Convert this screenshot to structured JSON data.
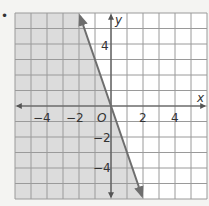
{
  "bullet": "•",
  "chart_data": {
    "type": "line",
    "title": "",
    "xlabel": "x",
    "ylabel": "y",
    "xlim": [
      -6,
      6
    ],
    "ylim": [
      -6,
      6
    ],
    "grid": true,
    "x_ticks": [
      -4,
      -2,
      2,
      4
    ],
    "y_ticks": [
      4,
      -2,
      -4
    ],
    "x_tick_labels": [
      "−4",
      "−2",
      "2",
      "4"
    ],
    "y_tick_labels": [
      "4",
      "−2",
      "−4"
    ],
    "origin_label": "O",
    "series": [
      {
        "name": "boundary line",
        "x": [
          -2,
          0,
          2
        ],
        "y": [
          6,
          0,
          -6
        ],
        "equation": "y = -3x",
        "style": "solid",
        "arrows": "both"
      }
    ],
    "shaded_region": "left of line (y < -3x)",
    "colors": {
      "shade": "#dcdcdc",
      "line": "#6e6e6e",
      "grid": "#9a9a9a",
      "background": "#ffffff"
    }
  }
}
